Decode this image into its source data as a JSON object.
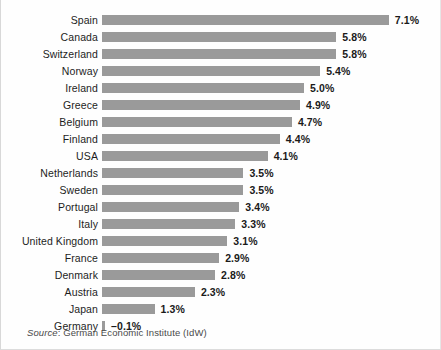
{
  "chart_data": {
    "type": "bar",
    "orientation": "horizontal",
    "title": "",
    "subtitle": "",
    "xlabel": "",
    "ylabel": "",
    "grid": false,
    "legend": null,
    "xlim": [
      -0.1,
      7.1
    ],
    "value_suffix": "%",
    "categories": [
      "Spain",
      "Canada",
      "Switzerland",
      "Norway",
      "Ireland",
      "Greece",
      "Belgium",
      "Finland",
      "USA",
      "Netherlands",
      "Sweden",
      "Portugal",
      "Italy",
      "United Kingdom",
      "France",
      "Denmark",
      "Austria",
      "Japan",
      "Germany"
    ],
    "values": [
      7.1,
      5.8,
      5.8,
      5.4,
      5.0,
      4.9,
      4.7,
      4.4,
      4.1,
      3.5,
      3.5,
      3.4,
      3.3,
      3.1,
      2.9,
      2.8,
      2.3,
      1.3,
      -0.1
    ],
    "value_labels": [
      "7.1%",
      "5.8%",
      "5.8%",
      "5.4%",
      "5.0%",
      "4.9%",
      "4.7%",
      "4.4%",
      "4.1%",
      "3.5%",
      "3.5%",
      "3.4%",
      "3.3%",
      "3.1%",
      "2.9%",
      "2.8%",
      "2.3%",
      "1.3%",
      "–0.1%"
    ],
    "bar_color": "#9a9a9a",
    "label_color": "#1a1a1a"
  },
  "source": {
    "prefix": "Source",
    "separator": ": ",
    "text": "German Economic Institute (IdW)"
  }
}
